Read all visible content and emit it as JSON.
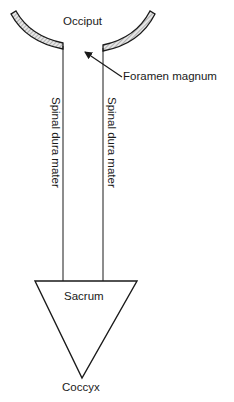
{
  "diagram": {
    "labels": {
      "occiput": "Occiput",
      "foramen_magnum": "Foramen magnum",
      "spinal_dura_left": "Spinal dura mater",
      "spinal_dura_right": "Spinal dura mater",
      "sacrum": "Sacrum",
      "coccyx": "Coccyx"
    },
    "colors": {
      "line": "#1a1a1a",
      "bone_fill": "#bdbdbd",
      "background": "#ffffff"
    }
  }
}
